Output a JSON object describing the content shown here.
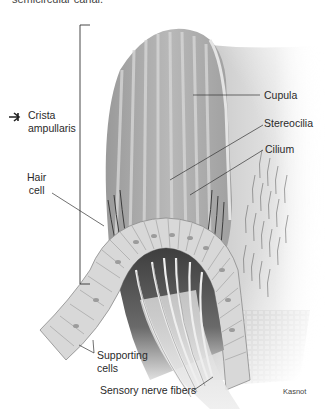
{
  "caption_fragment": "semicircular canal.",
  "diagram": {
    "labels": {
      "crista_ampullaris_line1": "Crista",
      "crista_ampullaris_line2": "ampullaris",
      "hair_cell_line1": "Hair",
      "hair_cell_line2": "cell",
      "cupula": "Cupula",
      "stereocilia": "Stereocilia",
      "cilium": "Cilium",
      "supporting_cells_line1": "Supporting",
      "supporting_cells_line2": "cells",
      "sensory_nerve_fibers": "Sensory nerve fibers"
    },
    "credit": "Kasnot",
    "marker_icon": "arrow-pointer-icon"
  }
}
